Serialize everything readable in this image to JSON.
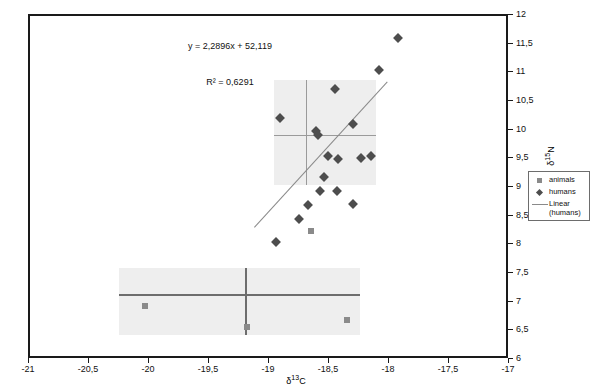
{
  "chart_data": {
    "type": "scatter",
    "title": "",
    "annotations": [
      "y = 2,2896x + 52,119",
      "R² = 0,6291"
    ],
    "xlabel": "δ¹³C",
    "ylabel": "δ¹⁵N",
    "xlim": [
      -21,
      -17
    ],
    "ylim": [
      6,
      12
    ],
    "xticks": [
      -21,
      -20.5,
      -20,
      -19.5,
      -19,
      -18.5,
      -18,
      -17.5,
      -17
    ],
    "xtick_labels": [
      "-21",
      "-20,5",
      "-20",
      "-19,5",
      "-19",
      "-18,5",
      "-18",
      "-17,5",
      "-17"
    ],
    "yticks": [
      6,
      6.5,
      7,
      7.5,
      8,
      8.5,
      9,
      9.5,
      10,
      10.5,
      11,
      11.5,
      12
    ],
    "ytick_labels": [
      "6",
      "6,5",
      "7",
      "7,5",
      "8",
      "8,5",
      "9",
      "9,5",
      "10",
      "10,5",
      "11",
      "11,5",
      "12"
    ],
    "grid": false,
    "legend_position": "right",
    "legend": [
      {
        "label": "animals",
        "key": "square-marker",
        "color": "#8a8a8a"
      },
      {
        "label": "humans",
        "key": "diamond-marker",
        "color": "#4d4d4d"
      },
      {
        "label": "Linear\n(humans)",
        "key": "line",
        "color": "#8a8a8a"
      }
    ],
    "series": [
      {
        "name": "humans",
        "marker": "diamond",
        "color": "#4d4d4d",
        "points": [
          [
            -18.46,
            10.72
          ],
          [
            -18.92,
            10.22
          ],
          [
            -18.62,
            10.0
          ],
          [
            -18.6,
            9.93
          ],
          [
            -18.31,
            10.12
          ],
          [
            -18.43,
            9.5
          ],
          [
            -18.24,
            9.53
          ],
          [
            -18.16,
            9.55
          ],
          [
            -18.52,
            9.55
          ],
          [
            -18.55,
            9.19
          ],
          [
            -18.44,
            8.94
          ],
          [
            -18.58,
            8.94
          ],
          [
            -18.68,
            8.7
          ],
          [
            -18.31,
            8.72
          ],
          [
            -18.76,
            8.46
          ],
          [
            -18.09,
            11.05
          ],
          [
            -17.93,
            11.62
          ],
          [
            -18.95,
            8.05
          ]
        ]
      },
      {
        "name": "animals",
        "marker": "square",
        "color": "#8a8a8a",
        "points": [
          [
            -18.66,
            8.25
          ],
          [
            -20.04,
            6.95
          ],
          [
            -19.19,
            6.58
          ],
          [
            -18.36,
            6.7
          ]
        ]
      }
    ],
    "trend_line": {
      "name": "Linear (humans)",
      "slope": 2.2896,
      "intercept": 52.119,
      "r_squared": 0.6291,
      "color": "#8a8a8a",
      "x_start": -19.13,
      "x_end": -18.02
    },
    "shaded_regions": [
      {
        "name": "upper-cluster-box",
        "x_range": [
          -18.97,
          -18.12
        ],
        "y_range": [
          9.05,
          10.88
        ],
        "fill": "#eeeeee",
        "centroid": [
          -18.7,
          9.92
        ]
      },
      {
        "name": "lower-cluster-box",
        "x_range": [
          -20.26,
          -18.25
        ],
        "y_range": [
          6.44,
          7.61
        ],
        "fill": "#eeeeee",
        "centroid": [
          -19.21,
          7.15
        ]
      }
    ]
  },
  "colors": {
    "frame": "#1a1a1a",
    "humans_marker": "#4d4d4d",
    "animals_marker": "#8a8a8a",
    "trend": "#8a8a8a",
    "box_fill": "#eeeeee",
    "box_cross": "#9a9a9a",
    "background": "#ffffff"
  }
}
